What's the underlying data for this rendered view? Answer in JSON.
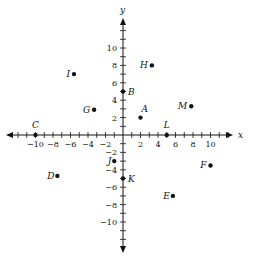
{
  "axes": {
    "x_label": "x",
    "y_label": "y",
    "x_ticks": [
      -10,
      -8,
      -6,
      -4,
      -2,
      2,
      4,
      6,
      8,
      10
    ],
    "y_ticks": [
      10,
      8,
      6,
      4,
      2,
      -2,
      -4,
      -6,
      -8,
      -10
    ],
    "range": [
      -12,
      12
    ]
  },
  "points": [
    {
      "label": "A",
      "x": 2,
      "y": 2
    },
    {
      "label": "B",
      "x": 0,
      "y": 5
    },
    {
      "label": "C",
      "x": -10,
      "y": 0
    },
    {
      "label": "D",
      "x": -7.5,
      "y": -4.7
    },
    {
      "label": "E",
      "x": 5.7,
      "y": -7
    },
    {
      "label": "F",
      "x": 10,
      "y": -3.5
    },
    {
      "label": "G",
      "x": -3.3,
      "y": 2.9
    },
    {
      "label": "H",
      "x": 3.3,
      "y": 8
    },
    {
      "label": "I",
      "x": -5.6,
      "y": 7
    },
    {
      "label": "J",
      "x": -1,
      "y": -3
    },
    {
      "label": "K",
      "x": 0,
      "y": -5
    },
    {
      "label": "L",
      "x": 5,
      "y": 0
    },
    {
      "label": "M",
      "x": 7.8,
      "y": 3.3
    }
  ],
  "chart_data": {
    "type": "scatter",
    "title": "",
    "xlabel": "x",
    "ylabel": "y",
    "xlim": [
      -12,
      12
    ],
    "ylim": [
      -12,
      12
    ],
    "grid": false,
    "points": [
      {
        "label": "A",
        "x": 2,
        "y": 2
      },
      {
        "label": "B",
        "x": 0,
        "y": 5
      },
      {
        "label": "C",
        "x": -10,
        "y": 0
      },
      {
        "label": "D",
        "x": -7.5,
        "y": -4.7
      },
      {
        "label": "E",
        "x": 5.7,
        "y": -7
      },
      {
        "label": "F",
        "x": 10,
        "y": -3.5
      },
      {
        "label": "G",
        "x": -3.3,
        "y": 2.9
      },
      {
        "label": "H",
        "x": 3.3,
        "y": 8
      },
      {
        "label": "I",
        "x": -5.6,
        "y": 7
      },
      {
        "label": "J",
        "x": -1,
        "y": -3
      },
      {
        "label": "K",
        "x": 0,
        "y": -5
      },
      {
        "label": "L",
        "x": 5,
        "y": 0
      },
      {
        "label": "M",
        "x": 7.8,
        "y": 3.3
      }
    ]
  }
}
